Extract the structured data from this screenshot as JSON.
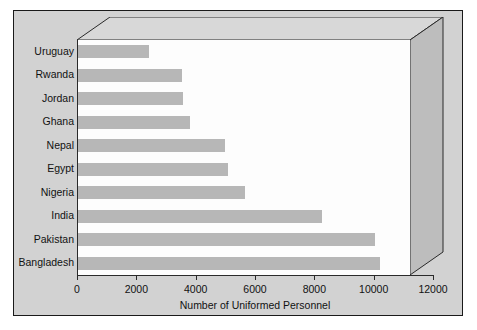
{
  "chart_data": {
    "type": "bar",
    "orientation": "horizontal",
    "title": "",
    "xlabel": "Number of Uniformed Personnel",
    "ylabel": "",
    "xlim": [
      0,
      12000
    ],
    "xticks": [
      0,
      2000,
      4000,
      6000,
      8000,
      10000,
      12000
    ],
    "xtick_labels": [
      "0",
      "2000",
      "4000",
      "6000",
      "8000",
      "10000",
      "12000"
    ],
    "grid": false,
    "legend": false,
    "bar_color": "#b7b7b7",
    "categories": [
      "Uruguay",
      "Rwanda",
      "Jordan",
      "Ghana",
      "Nepal",
      "Egypt",
      "Nigeria",
      "India",
      "Pakistan",
      "Bangladesh"
    ],
    "values": [
      2550,
      3750,
      3800,
      4050,
      5300,
      5400,
      6000,
      8800,
      10700,
      10900
    ],
    "bars": [
      {
        "label": "Uruguay",
        "value": 2550
      },
      {
        "label": "Rwanda",
        "value": 3750
      },
      {
        "label": "Jordan",
        "value": 3800
      },
      {
        "label": "Ghana",
        "value": 4050
      },
      {
        "label": "Nepal",
        "value": 5300
      },
      {
        "label": "Egypt",
        "value": 5400
      },
      {
        "label": "Nigeria",
        "value": 6000
      },
      {
        "label": "India",
        "value": 8800
      },
      {
        "label": "Pakistan",
        "value": 10700
      },
      {
        "label": "Bangladesh",
        "value": 10900
      }
    ]
  },
  "figure": {
    "background_color": "#d2d2d2",
    "plot_background_color": "#fdfdfd",
    "frame_color": "#1a1a1a",
    "three_d": true
  }
}
